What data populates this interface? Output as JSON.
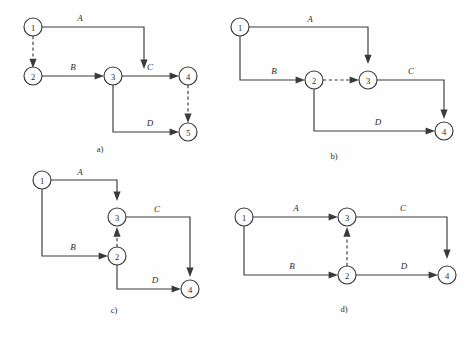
{
  "figure": {
    "background_color": "#fefefe",
    "ink_color": "#3a3a3a",
    "width": 476,
    "height": 338
  },
  "panels": [
    {
      "id": "a",
      "caption": "a)",
      "caption_x": 100,
      "caption_y": 152,
      "nodes": [
        {
          "label": "1",
          "x": 33,
          "y": 27,
          "r": 9
        },
        {
          "label": "2",
          "x": 33,
          "y": 76,
          "r": 9
        },
        {
          "label": "3",
          "x": 113,
          "y": 76,
          "r": 9
        },
        {
          "label": "4",
          "x": 188,
          "y": 76,
          "r": 9
        },
        {
          "label": "5",
          "x": 188,
          "y": 132,
          "r": 9
        }
      ],
      "edges": [
        {
          "label": "A",
          "style": "solid",
          "from": "1",
          "to": "3",
          "label_x": 80,
          "label_y": 21
        },
        {
          "label": "",
          "style": "dashed",
          "from": "1",
          "to": "2",
          "label_x": 0,
          "label_y": 0
        },
        {
          "label": "B",
          "style": "solid",
          "from": "2",
          "to": "3",
          "label_x": 73,
          "label_y": 70
        },
        {
          "label": "C",
          "style": "solid",
          "from": "3",
          "to": "4",
          "label_x": 150,
          "label_y": 70
        },
        {
          "label": "D",
          "style": "solid",
          "from": "3",
          "to": "5",
          "label_x": 150,
          "label_y": 126
        },
        {
          "label": "",
          "style": "dashed",
          "from": "4",
          "to": "5",
          "label_x": 0,
          "label_y": 0
        }
      ]
    },
    {
      "id": "b",
      "caption": "b)",
      "caption_x": 334,
      "caption_y": 159,
      "nodes": [
        {
          "label": "1",
          "x": 240,
          "y": 27,
          "r": 9
        },
        {
          "label": "2",
          "x": 314,
          "y": 80,
          "r": 9
        },
        {
          "label": "3",
          "x": 368,
          "y": 80,
          "r": 9
        },
        {
          "label": "4",
          "x": 444,
          "y": 131,
          "r": 9
        }
      ],
      "edges": [
        {
          "label": "A",
          "style": "solid",
          "from": "1",
          "to": "3",
          "label_x": 310,
          "label_y": 22
        },
        {
          "label": "B",
          "style": "solid",
          "from": "1",
          "to": "2",
          "label_x": 274,
          "label_y": 74
        },
        {
          "label": "",
          "style": "dashed",
          "from": "2",
          "to": "3",
          "label_x": 0,
          "label_y": 0
        },
        {
          "label": "C",
          "style": "solid",
          "from": "3",
          "to": "4",
          "label_x": 411,
          "label_y": 74
        },
        {
          "label": "D",
          "style": "solid",
          "from": "2",
          "to": "4",
          "label_x": 378,
          "label_y": 125
        }
      ]
    },
    {
      "id": "c",
      "caption": "c)",
      "caption_x": 114,
      "caption_y": 313,
      "nodes": [
        {
          "label": "1",
          "x": 42,
          "y": 180,
          "r": 9
        },
        {
          "label": "3",
          "x": 117,
          "y": 217,
          "r": 9
        },
        {
          "label": "2",
          "x": 117,
          "y": 256,
          "r": 9
        },
        {
          "label": "4",
          "x": 190,
          "y": 289,
          "r": 9
        }
      ],
      "edges": [
        {
          "label": "A",
          "style": "solid",
          "from": "1",
          "to": "3",
          "label_x": 80,
          "label_y": 175
        },
        {
          "label": "B",
          "style": "solid",
          "from": "1",
          "to": "2",
          "label_x": 73,
          "label_y": 250
        },
        {
          "label": "",
          "style": "dashed",
          "from": "2",
          "to": "3",
          "label_x": 0,
          "label_y": 0
        },
        {
          "label": "C",
          "style": "solid",
          "from": "3",
          "to": "4",
          "label_x": 157,
          "label_y": 212
        },
        {
          "label": "D",
          "style": "solid",
          "from": "2",
          "to": "4",
          "label_x": 155,
          "label_y": 283
        }
      ]
    },
    {
      "id": "d",
      "caption": "d)",
      "caption_x": 344,
      "caption_y": 312,
      "nodes": [
        {
          "label": "1",
          "x": 244,
          "y": 217,
          "r": 9
        },
        {
          "label": "3",
          "x": 347,
          "y": 217,
          "r": 9
        },
        {
          "label": "2",
          "x": 347,
          "y": 275,
          "r": 9
        },
        {
          "label": "4",
          "x": 447,
          "y": 275,
          "r": 9
        }
      ],
      "edges": [
        {
          "label": "A",
          "style": "solid",
          "from": "1",
          "to": "3",
          "label_x": 296,
          "label_y": 211
        },
        {
          "label": "B",
          "style": "solid",
          "from": "1",
          "to": "2",
          "label_x": 292,
          "label_y": 269
        },
        {
          "label": "",
          "style": "dashed",
          "from": "2",
          "to": "3",
          "label_x": 0,
          "label_y": 0
        },
        {
          "label": "C",
          "style": "solid",
          "from": "3",
          "to": "4",
          "label_x": 403,
          "label_y": 211
        },
        {
          "label": "D",
          "style": "solid",
          "from": "2",
          "to": "4",
          "label_x": 404,
          "label_y": 269
        }
      ]
    }
  ]
}
